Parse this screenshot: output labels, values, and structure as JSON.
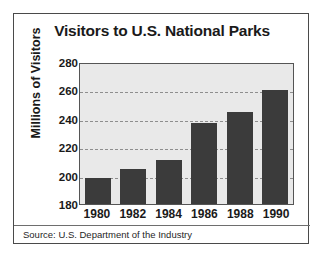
{
  "figure": {
    "title": "Visitors to U.S. National Parks",
    "source_note": "Source: U.S. Department of the Industry"
  },
  "chart_data": {
    "type": "bar",
    "title": "Visitors to U.S. National Parks",
    "xlabel": "",
    "ylabel": "Millions of Visitors",
    "categories": [
      "1980",
      "1982",
      "1984",
      "1986",
      "1988",
      "1990"
    ],
    "values": [
      198,
      205,
      211,
      237,
      245,
      260
    ],
    "ylim": [
      180,
      280
    ],
    "yticks": [
      180,
      200,
      220,
      240,
      260,
      280
    ],
    "ytick_labels": [
      "180",
      "200",
      "220",
      "240",
      "260",
      "280"
    ],
    "grid": true,
    "gridlines_at": [
      200,
      220,
      240,
      260
    ],
    "legend": null,
    "bar_color": "#3b3b3b",
    "plot_background": "#e9e9e9",
    "annotations": [
      "Source: U.S. Department of the Industry"
    ]
  }
}
